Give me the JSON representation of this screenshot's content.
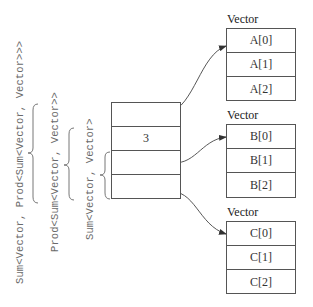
{
  "labels": {
    "outer": "Sum<Vector, Prod<Sum<Vector, Vector>>>",
    "middle": "Prod<Sum<Vector, Vector>>",
    "inner": "Sum<Vector, Vector>"
  },
  "stack": {
    "cells": [
      "",
      "3",
      "",
      ""
    ]
  },
  "vectors": [
    {
      "title": "Vector",
      "cells": [
        "A[0]",
        "A[1]",
        "A[2]"
      ]
    },
    {
      "title": "Vector",
      "cells": [
        "B[0]",
        "B[1]",
        "B[2]"
      ]
    },
    {
      "title": "Vector",
      "cells": [
        "C[0]",
        "C[1]",
        "C[2]"
      ]
    }
  ],
  "colors": {
    "line": "#555555",
    "label_text": "#6a6a6a",
    "brace": "#777777"
  }
}
